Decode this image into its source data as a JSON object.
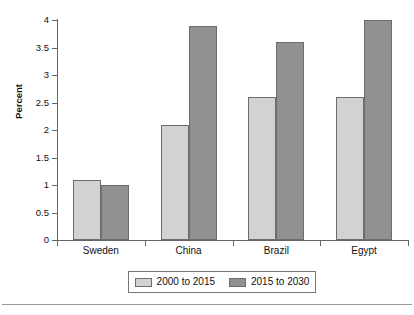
{
  "chart_data": {
    "type": "bar",
    "title": "",
    "xlabel": "",
    "ylabel": "Percent",
    "ylim": [
      0,
      4
    ],
    "ytick_labels": [
      "0",
      "0.5",
      "1",
      "1.5",
      "2",
      "2.5",
      "3",
      "3.5",
      "4"
    ],
    "ytick_values": [
      0,
      0.5,
      1,
      1.5,
      2,
      2.5,
      3,
      3.5,
      4
    ],
    "grid": false,
    "legend_position": "bottom",
    "categories": [
      "Sweden",
      "China",
      "Brazil",
      "Egypt"
    ],
    "series": [
      {
        "name": "2000 to 2015",
        "color": "#d2d2d2",
        "values": [
          1.1,
          2.1,
          2.6,
          2.6
        ]
      },
      {
        "name": "2015 to 2030",
        "color": "#919191",
        "values": [
          1.0,
          3.9,
          3.6,
          4.0
        ]
      }
    ]
  }
}
